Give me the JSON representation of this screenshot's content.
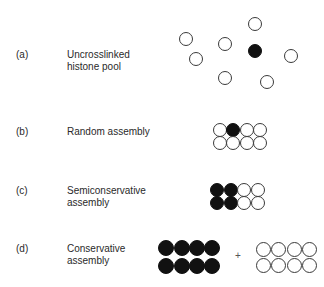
{
  "rows": [
    {
      "tag": "(a)",
      "line1": "Uncrosslinked",
      "line2": "histone pool"
    },
    {
      "tag": "(b)",
      "line1": "Random assembly",
      "line2": ""
    },
    {
      "tag": "(c)",
      "line1": "Semiconservative",
      "line2": "assembly"
    },
    {
      "tag": "(d)",
      "line1": "Conservative",
      "line2": "assembly"
    }
  ],
  "plus_sign": "+",
  "colors": {
    "filled": "#111111",
    "outline": "#3a3a3a"
  }
}
